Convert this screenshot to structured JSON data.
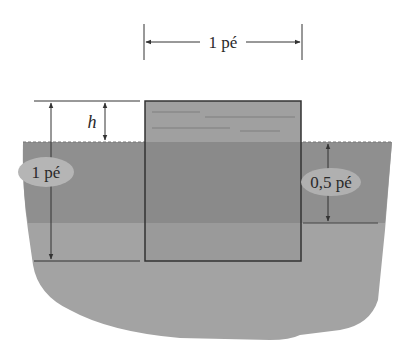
{
  "diagram": {
    "type": "floating-block-in-water",
    "labels": {
      "block_width": "1 pé",
      "block_height": "1 pé",
      "submerged_depth": "0,5 pé",
      "exposed_height": "h"
    },
    "colors": {
      "background": "#ffffff",
      "water_upper": "#8f8f8f",
      "water_lower": "#a3a3a3",
      "block_above": "#9e9e9e",
      "block_below": "#8a8a8a",
      "lines": "#333333",
      "label_ellipse": "#b5b5b5"
    }
  }
}
